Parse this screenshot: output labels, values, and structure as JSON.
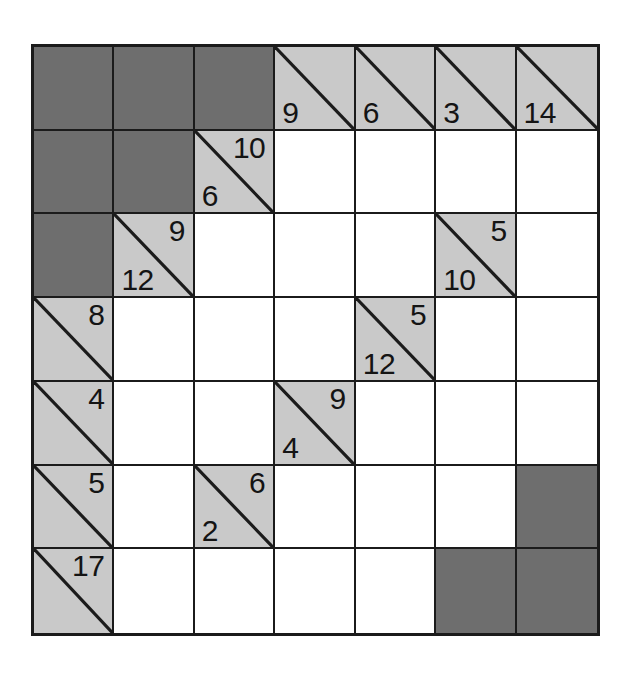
{
  "puzzle": {
    "type": "kakuro",
    "rows": 7,
    "cols": 7,
    "colors": {
      "block": "#6e6e6e",
      "clue": "#c9c9c9",
      "entry": "#ffffff",
      "line": "#1b1b1b",
      "text": "#141414"
    },
    "cells": [
      [
        {
          "kind": "block"
        },
        {
          "kind": "block"
        },
        {
          "kind": "block"
        },
        {
          "kind": "clue",
          "down": "9",
          "right": ""
        },
        {
          "kind": "clue",
          "down": "6",
          "right": ""
        },
        {
          "kind": "clue",
          "down": "3",
          "right": ""
        },
        {
          "kind": "clue",
          "down": "14",
          "right": ""
        }
      ],
      [
        {
          "kind": "block"
        },
        {
          "kind": "block"
        },
        {
          "kind": "clue",
          "down": "6",
          "right": "10"
        },
        {
          "kind": "entry",
          "value": ""
        },
        {
          "kind": "entry",
          "value": ""
        },
        {
          "kind": "entry",
          "value": ""
        },
        {
          "kind": "entry",
          "value": ""
        }
      ],
      [
        {
          "kind": "block"
        },
        {
          "kind": "clue",
          "down": "12",
          "right": "9"
        },
        {
          "kind": "entry",
          "value": ""
        },
        {
          "kind": "entry",
          "value": ""
        },
        {
          "kind": "entry",
          "value": ""
        },
        {
          "kind": "clue",
          "down": "10",
          "right": "5"
        },
        {
          "kind": "entry",
          "value": ""
        }
      ],
      [
        {
          "kind": "clue",
          "down": "",
          "right": "8"
        },
        {
          "kind": "entry",
          "value": ""
        },
        {
          "kind": "entry",
          "value": ""
        },
        {
          "kind": "entry",
          "value": ""
        },
        {
          "kind": "clue",
          "down": "12",
          "right": "5"
        },
        {
          "kind": "entry",
          "value": ""
        },
        {
          "kind": "entry",
          "value": ""
        }
      ],
      [
        {
          "kind": "clue",
          "down": "",
          "right": "4"
        },
        {
          "kind": "entry",
          "value": ""
        },
        {
          "kind": "entry",
          "value": ""
        },
        {
          "kind": "clue",
          "down": "4",
          "right": "9"
        },
        {
          "kind": "entry",
          "value": ""
        },
        {
          "kind": "entry",
          "value": ""
        },
        {
          "kind": "entry",
          "value": ""
        }
      ],
      [
        {
          "kind": "clue",
          "down": "",
          "right": "5"
        },
        {
          "kind": "entry",
          "value": ""
        },
        {
          "kind": "clue",
          "down": "2",
          "right": "6"
        },
        {
          "kind": "entry",
          "value": ""
        },
        {
          "kind": "entry",
          "value": ""
        },
        {
          "kind": "entry",
          "value": ""
        },
        {
          "kind": "block"
        }
      ],
      [
        {
          "kind": "clue",
          "down": "",
          "right": "17"
        },
        {
          "kind": "entry",
          "value": ""
        },
        {
          "kind": "entry",
          "value": ""
        },
        {
          "kind": "entry",
          "value": ""
        },
        {
          "kind": "entry",
          "value": ""
        },
        {
          "kind": "block"
        },
        {
          "kind": "block"
        }
      ]
    ]
  }
}
